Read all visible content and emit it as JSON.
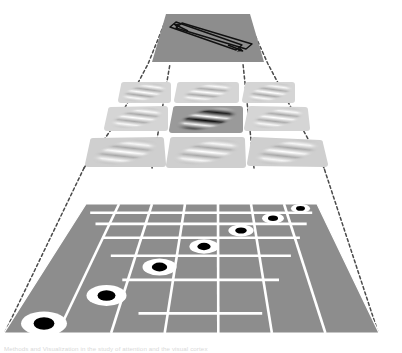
{
  "figure": {
    "background_color": "#ffffff",
    "ghost_caption": "Methods and Visualization in the study of attention and the visual cortex"
  },
  "colors": {
    "panel_gray": "#8d8d8d",
    "panel_gray_light": "#c9c9c9",
    "panel_gray_lighter": "#d5d5d5",
    "gabor_center_bg": "#9a9a9a",
    "grid_line": "#ffffff",
    "dash_line": "#4a4a4a",
    "stroke_dark": "#1a1a1a",
    "white": "#ffffff",
    "black": "#000000"
  },
  "layers": [
    {
      "id": "top-panel",
      "name": "motion-direction-panel",
      "label": "Direction-selective output panel",
      "shape": "trapezoid",
      "fill": "#8d8d8d",
      "arrows": [
        {
          "name": "arrow-up-left",
          "direction": "upper-left",
          "angle_deg": 135
        },
        {
          "name": "arrow-down-right",
          "direction": "lower-right",
          "angle_deg": -45
        }
      ]
    },
    {
      "id": "middle-layer",
      "name": "gabor-layer",
      "label": "Oriented (Gabor) receptive field layer",
      "rows": 3,
      "cols": 3,
      "highlighted_cell": {
        "row": 2,
        "col": 2
      },
      "cells": [
        {
          "row": 1,
          "col": 1,
          "name": "gabor-cell-1-1",
          "contrast": "low",
          "orientation_deg": 28
        },
        {
          "row": 1,
          "col": 2,
          "name": "gabor-cell-1-2",
          "contrast": "low",
          "orientation_deg": 28
        },
        {
          "row": 1,
          "col": 3,
          "name": "gabor-cell-1-3",
          "contrast": "low",
          "orientation_deg": 28
        },
        {
          "row": 2,
          "col": 1,
          "name": "gabor-cell-2-1",
          "contrast": "low",
          "orientation_deg": 28
        },
        {
          "row": 2,
          "col": 2,
          "name": "gabor-cell-2-2",
          "contrast": "high",
          "orientation_deg": 28
        },
        {
          "row": 2,
          "col": 3,
          "name": "gabor-cell-2-3",
          "contrast": "low",
          "orientation_deg": 28
        },
        {
          "row": 3,
          "col": 1,
          "name": "gabor-cell-3-1",
          "contrast": "low",
          "orientation_deg": 28
        },
        {
          "row": 3,
          "col": 2,
          "name": "gabor-cell-3-2",
          "contrast": "low",
          "orientation_deg": 28
        },
        {
          "row": 3,
          "col": 3,
          "name": "gabor-cell-3-3",
          "contrast": "low",
          "orientation_deg": 28
        }
      ]
    },
    {
      "id": "bottom-layer",
      "name": "center-surround-layer",
      "label": "Center-surround (ON-centre) receptive field sheet",
      "rows": 7,
      "cols": 7,
      "fill": "#8d8d8d",
      "grid_line_color": "#ffffff",
      "receptive_fields": [
        {
          "name": "rf-dot-1",
          "row": 1,
          "col": 7,
          "type": "on-center"
        },
        {
          "name": "rf-dot-2",
          "row": 2,
          "col": 6,
          "type": "on-center"
        },
        {
          "name": "rf-dot-3",
          "row": 3,
          "col": 5,
          "type": "on-center"
        },
        {
          "name": "rf-dot-4",
          "row": 4,
          "col": 4,
          "type": "on-center"
        },
        {
          "name": "rf-dot-5",
          "row": 5,
          "col": 3,
          "type": "on-center"
        },
        {
          "name": "rf-dot-6",
          "row": 6,
          "col": 2,
          "type": "on-center"
        },
        {
          "name": "rf-dot-7",
          "row": 7,
          "col": 1,
          "type": "on-center"
        }
      ]
    }
  ],
  "connections": {
    "name": "projection-cone",
    "style": "dashed",
    "color": "#4a4a4a",
    "description": "Dashed lines link the corners of each layer upward, forming a converging projection cone from the bottom sheet through the Gabor layer to the top panel."
  }
}
